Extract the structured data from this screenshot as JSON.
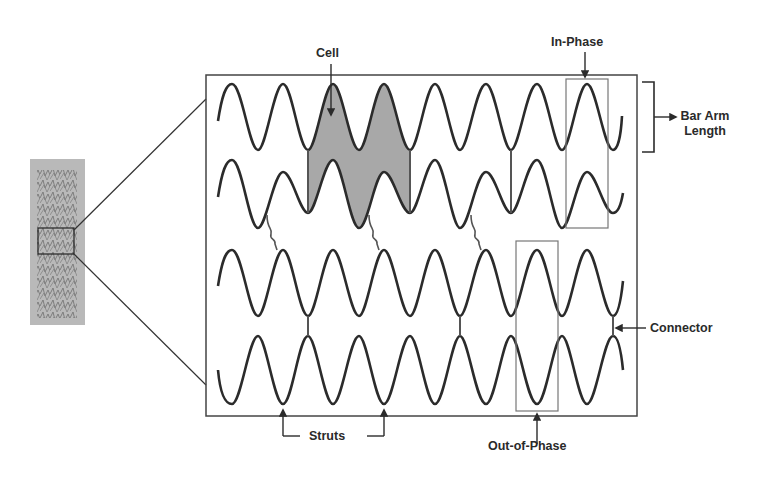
{
  "labels": {
    "cell": "Cell",
    "in_phase": "In-Phase",
    "bar_arm_length_line1": "Bar Arm",
    "bar_arm_length_line2": "Length",
    "connector": "Connector",
    "struts": "Struts",
    "out_of_phase": "Out-of-Phase"
  },
  "colors": {
    "background": "#ffffff",
    "stroke": "#2b2b2b",
    "frame": "#444444",
    "cell_fill": "#a8a8a8",
    "box_stroke": "#777777",
    "stent_photo_bg": "#b9b9b9"
  },
  "diagram": {
    "frame": {
      "x": 206,
      "y": 75,
      "width": 431,
      "height": 341
    },
    "period_px": 50.8,
    "rows": [
      {
        "name": "row-1",
        "mid_y": 117,
        "amplitude": 33,
        "phase": "peak-at-232"
      },
      {
        "name": "row-2",
        "mid_y": 194,
        "amplitude": "alternating",
        "phase": "peak-at-232"
      },
      {
        "name": "row-3",
        "mid_y": 283,
        "amplitude": 33,
        "phase": "peak-at-232"
      },
      {
        "name": "row-4",
        "mid_y": 370,
        "amplitude": 34,
        "phase": "trough-at-232"
      }
    ],
    "annotations": [
      {
        "id": "cell",
        "target": "shaded cell between rows 1 and 2"
      },
      {
        "id": "in-phase",
        "target": "boxed in-phase peaks rows 1-2"
      },
      {
        "id": "bar-arm-length",
        "target": "bracket spanning row 1 height"
      },
      {
        "id": "connector",
        "target": "short vertical connector rows 3-4"
      },
      {
        "id": "struts",
        "target": "two strut vertices on row 4"
      },
      {
        "id": "out-of-phase",
        "target": "boxed out-of-phase peaks rows 3-4"
      }
    ]
  }
}
